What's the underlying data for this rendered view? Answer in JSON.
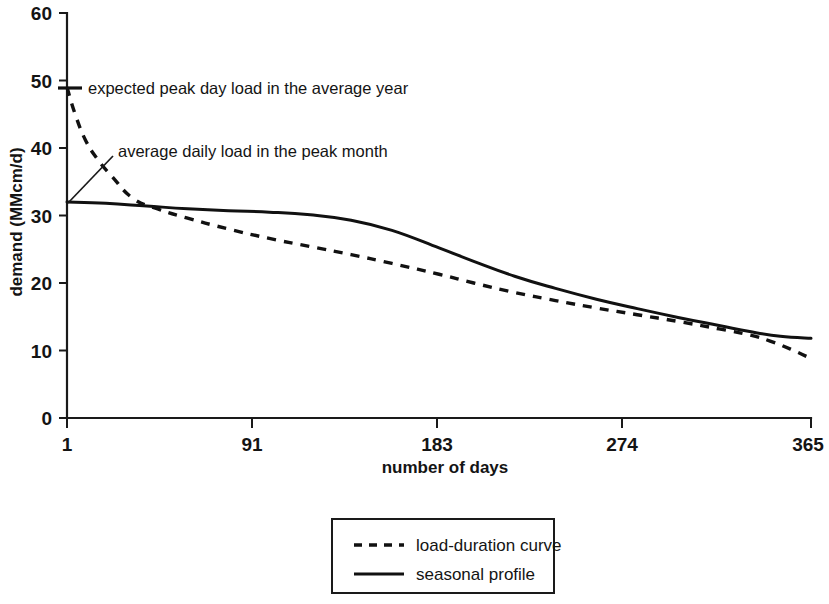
{
  "chart_data": {
    "type": "line",
    "title": "",
    "xlabel": "number of days",
    "ylabel": "demand (MMcm/d)",
    "xlim": [
      1,
      365
    ],
    "ylim": [
      0,
      60
    ],
    "grid": false,
    "legend_position": "bottom-center",
    "x_ticks": [
      1,
      91,
      183,
      274,
      365
    ],
    "x_tick_labels": [
      "1",
      "91",
      "183",
      "274",
      "365"
    ],
    "y_ticks": [
      0,
      10,
      20,
      30,
      40,
      50,
      60
    ],
    "y_tick_labels": [
      "0",
      "10",
      "20",
      "30",
      "40",
      "50",
      "60"
    ],
    "series": [
      {
        "name": "load-duration curve",
        "style": "dashed",
        "x": [
          1,
          5,
          10,
          16,
          23,
          33,
          45,
          60,
          80,
          100,
          120,
          140,
          160,
          183,
          200,
          220,
          240,
          260,
          280,
          300,
          320,
          335,
          345,
          355,
          365
        ],
        "values": [
          49.0,
          45.0,
          41.2,
          38.3,
          35.8,
          32.6,
          31.0,
          29.6,
          28.0,
          26.6,
          25.4,
          24.2,
          22.9,
          21.3,
          20.0,
          18.6,
          17.4,
          16.3,
          15.3,
          14.3,
          13.2,
          12.3,
          11.4,
          10.2,
          8.8
        ]
      },
      {
        "name": "seasonal profile",
        "style": "solid",
        "x": [
          1,
          20,
          40,
          60,
          80,
          100,
          120,
          140,
          160,
          183,
          200,
          220,
          240,
          260,
          280,
          300,
          320,
          335,
          350,
          365
        ],
        "values": [
          32.0,
          31.8,
          31.4,
          31.0,
          30.7,
          30.5,
          30.1,
          29.3,
          27.8,
          25.2,
          23.2,
          21.0,
          19.2,
          17.6,
          16.2,
          14.9,
          13.7,
          12.8,
          12.1,
          11.8
        ]
      }
    ],
    "annotations": [
      {
        "name": "expected-peak-day-load",
        "text": "expected peak day load in the average year",
        "point_x": 1,
        "point_y": 49.0
      },
      {
        "name": "average-daily-load-peak-month",
        "text": "average daily load in the peak month",
        "point_x": 1,
        "point_y": 32.0
      }
    ],
    "legend": [
      {
        "label": "load-duration curve",
        "style": "dashed"
      },
      {
        "label": "seasonal profile",
        "style": "solid"
      }
    ]
  }
}
